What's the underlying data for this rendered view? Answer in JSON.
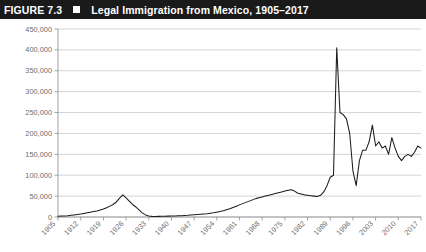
{
  "header": {
    "figure_number": "FIGURE 7.3",
    "bullet_icon": "square-bullet-icon",
    "title": "Legal Immigration from Mexico, 1905–2017",
    "band_color": "#1a1a1a",
    "text_color": "#ffffff"
  },
  "chart_data": {
    "type": "line",
    "title": "Legal Immigration from Mexico, 1905–2017",
    "xlabel": "",
    "ylabel": "",
    "ylim": [
      0,
      450000
    ],
    "xlim": [
      1905,
      2017
    ],
    "grid": true,
    "legend": false,
    "line_color": "#1d1d1d",
    "grid_color": "#b9b9b9",
    "axis_color": "#8c8c8c",
    "ytick_labels": [
      "450,000",
      "400,000",
      "350,000",
      "300,000",
      "250,000",
      "200,000",
      "150,000",
      "100,000",
      "50,000",
      "0"
    ],
    "ytick_values": [
      450000,
      400000,
      350000,
      300000,
      250000,
      200000,
      150000,
      100000,
      50000,
      0
    ],
    "xtick_labels": [
      "1905",
      "1912",
      "1919",
      "1926",
      "1933",
      "1940",
      "1947",
      "1954",
      "1961",
      "1968",
      "1975",
      "1982",
      "1989",
      "1996",
      "2003",
      "2010",
      "2017"
    ],
    "xtick_values": [
      1905,
      1912,
      1919,
      1926,
      1933,
      1940,
      1947,
      1954,
      1961,
      1968,
      1975,
      1982,
      1989,
      1996,
      2003,
      2010,
      2017
    ],
    "xtick_rotation": 45,
    "annotations": [
      {
        "text": "peak spike near 1991 at about 405,000",
        "x": 1991,
        "y": 405000
      }
    ],
    "x": [
      1905,
      1906,
      1907,
      1908,
      1909,
      1910,
      1911,
      1912,
      1913,
      1914,
      1915,
      1916,
      1917,
      1918,
      1919,
      1920,
      1921,
      1922,
      1923,
      1924,
      1925,
      1926,
      1927,
      1928,
      1929,
      1930,
      1931,
      1932,
      1933,
      1934,
      1935,
      1936,
      1937,
      1938,
      1939,
      1940,
      1941,
      1942,
      1943,
      1944,
      1945,
      1946,
      1947,
      1948,
      1949,
      1950,
      1951,
      1952,
      1953,
      1954,
      1955,
      1956,
      1957,
      1958,
      1959,
      1960,
      1961,
      1962,
      1963,
      1964,
      1965,
      1966,
      1967,
      1968,
      1969,
      1970,
      1971,
      1972,
      1973,
      1974,
      1975,
      1976,
      1977,
      1978,
      1979,
      1980,
      1981,
      1982,
      1983,
      1984,
      1985,
      1986,
      1987,
      1988,
      1989,
      1990,
      1991,
      1992,
      1993,
      1994,
      1995,
      1996,
      1997,
      1998,
      1999,
      2000,
      2001,
      2002,
      2003,
      2004,
      2005,
      2006,
      2007,
      2008,
      2009,
      2010,
      2011,
      2012,
      2013,
      2014,
      2015,
      2016,
      2017
    ],
    "y": [
      2000,
      2200,
      2500,
      3000,
      4000,
      5000,
      6000,
      7000,
      8500,
      10000,
      11500,
      13000,
      14500,
      16500,
      19000,
      22000,
      26000,
      30000,
      36000,
      45000,
      53000,
      46000,
      38000,
      30000,
      24000,
      17000,
      10000,
      5000,
      2500,
      1500,
      1400,
      1500,
      1700,
      1900,
      2100,
      2300,
      2600,
      2900,
      3200,
      3600,
      4000,
      4600,
      5200,
      5900,
      6600,
      7300,
      8000,
      9000,
      10000,
      11500,
      13000,
      15000,
      17500,
      20000,
      23000,
      26000,
      29000,
      32000,
      35000,
      38000,
      41000,
      44000,
      46000,
      48000,
      50000,
      52000,
      54000,
      56000,
      58000,
      60000,
      62000,
      64000,
      65000,
      62000,
      57000,
      55000,
      53000,
      52000,
      51000,
      50000,
      49000,
      52000,
      60000,
      75000,
      95000,
      100000,
      405000,
      250000,
      245000,
      235000,
      200000,
      110000,
      75000,
      135000,
      160000,
      160000,
      180000,
      220000,
      170000,
      180000,
      165000,
      170000,
      150000,
      190000,
      165000,
      145000,
      135000,
      145000,
      150000,
      145000,
      155000,
      170000,
      165000
    ]
  }
}
